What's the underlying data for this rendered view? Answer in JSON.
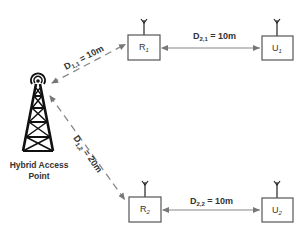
{
  "diagram": {
    "access_point": {
      "label_line1": "Hybrid Access",
      "label_line2": "Point"
    },
    "nodes": {
      "r1": {
        "main": "R",
        "sub": "1"
      },
      "u1": {
        "main": "U",
        "sub": "1"
      },
      "r2": {
        "main": "R",
        "sub": "2"
      },
      "u2": {
        "main": "U",
        "sub": "2"
      }
    },
    "links": {
      "d11": {
        "main": "D",
        "sub": "1,1",
        "value": " = 10m"
      },
      "d12": {
        "main": "D",
        "sub": "1,2",
        "value": " = 20m"
      },
      "d21": {
        "main": "D",
        "sub": "2,1",
        "value": " = 10m"
      },
      "d22": {
        "main": "D",
        "sub": "2,2",
        "value": " = 10m"
      }
    },
    "colors": {
      "arrow": "#888888",
      "box_stroke": "#555555",
      "tower": "#111111"
    }
  }
}
